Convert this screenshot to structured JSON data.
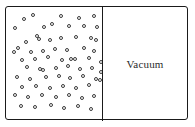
{
  "diagram": {
    "type": "free-expansion-container",
    "colors": {
      "border": "#1a1a1a",
      "divider": "#1a1a1a",
      "molecule_stroke": "#3a3a3a",
      "background": "#ffffff",
      "label_text": "#2b2b2b"
    },
    "container": {
      "x": 5,
      "y": 6,
      "width": 183,
      "height": 114,
      "border_width": 1.4,
      "corner_radius": 3
    },
    "divider": {
      "x": 96,
      "width": 1.4,
      "height": 114
    },
    "left_chamber": {
      "name": "gas-chamber",
      "label": "",
      "contents": "gas molecules",
      "molecule_count": 70,
      "molecule_diameter": 4.2
    },
    "right_chamber": {
      "name": "vacuum-chamber",
      "label": "Vacuum",
      "contents": "vacuum",
      "molecule_count": 0
    },
    "molecules": [
      {
        "x": 18,
        "y": 12
      },
      {
        "x": 38,
        "y": 20
      },
      {
        "x": 9,
        "y": 21
      },
      {
        "x": 27,
        "y": 8
      },
      {
        "x": 31,
        "y": 29
      },
      {
        "x": 55,
        "y": 9
      },
      {
        "x": 73,
        "y": 11
      },
      {
        "x": 88,
        "y": 9
      },
      {
        "x": 63,
        "y": 19
      },
      {
        "x": 78,
        "y": 19
      },
      {
        "x": 91,
        "y": 20
      },
      {
        "x": 46,
        "y": 17
      },
      {
        "x": 20,
        "y": 35
      },
      {
        "x": 33,
        "y": 32
      },
      {
        "x": 44,
        "y": 33
      },
      {
        "x": 55,
        "y": 31
      },
      {
        "x": 70,
        "y": 30
      },
      {
        "x": 85,
        "y": 31
      },
      {
        "x": 90,
        "y": 33
      },
      {
        "x": 12,
        "y": 41
      },
      {
        "x": 25,
        "y": 45
      },
      {
        "x": 8,
        "y": 45
      },
      {
        "x": 37,
        "y": 44
      },
      {
        "x": 49,
        "y": 42
      },
      {
        "x": 61,
        "y": 43
      },
      {
        "x": 78,
        "y": 41
      },
      {
        "x": 88,
        "y": 44
      },
      {
        "x": 16,
        "y": 53
      },
      {
        "x": 29,
        "y": 52
      },
      {
        "x": 42,
        "y": 50
      },
      {
        "x": 56,
        "y": 53
      },
      {
        "x": 65,
        "y": 52
      },
      {
        "x": 69,
        "y": 52
      },
      {
        "x": 83,
        "y": 51
      },
      {
        "x": 95,
        "y": 55
      },
      {
        "x": 21,
        "y": 60
      },
      {
        "x": 34,
        "y": 62
      },
      {
        "x": 37,
        "y": 63
      },
      {
        "x": 50,
        "y": 61
      },
      {
        "x": 62,
        "y": 59
      },
      {
        "x": 74,
        "y": 62
      },
      {
        "x": 86,
        "y": 61
      },
      {
        "x": 95,
        "y": 65
      },
      {
        "x": 11,
        "y": 70
      },
      {
        "x": 24,
        "y": 72
      },
      {
        "x": 40,
        "y": 70
      },
      {
        "x": 53,
        "y": 69
      },
      {
        "x": 64,
        "y": 71
      },
      {
        "x": 77,
        "y": 69
      },
      {
        "x": 90,
        "y": 72
      },
      {
        "x": 94,
        "y": 73
      },
      {
        "x": 16,
        "y": 80
      },
      {
        "x": 30,
        "y": 79
      },
      {
        "x": 44,
        "y": 81
      },
      {
        "x": 57,
        "y": 79
      },
      {
        "x": 70,
        "y": 81
      },
      {
        "x": 83,
        "y": 78
      },
      {
        "x": 9,
        "y": 88
      },
      {
        "x": 22,
        "y": 90
      },
      {
        "x": 36,
        "y": 88
      },
      {
        "x": 50,
        "y": 90
      },
      {
        "x": 63,
        "y": 88
      },
      {
        "x": 76,
        "y": 91
      },
      {
        "x": 88,
        "y": 89
      },
      {
        "x": 15,
        "y": 99
      },
      {
        "x": 29,
        "y": 100
      },
      {
        "x": 45,
        "y": 98
      },
      {
        "x": 58,
        "y": 101
      },
      {
        "x": 72,
        "y": 99
      },
      {
        "x": 85,
        "y": 102
      }
    ]
  }
}
